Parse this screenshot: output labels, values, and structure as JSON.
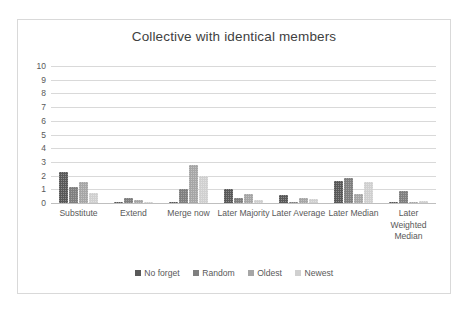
{
  "chart_data": {
    "type": "bar",
    "title": "Collective with identical members",
    "xlabel": "",
    "ylabel": "",
    "ylim": [
      0,
      10
    ],
    "yticks": [
      10,
      9,
      8,
      7,
      6,
      5,
      4,
      3,
      2,
      1,
      0
    ],
    "grid": true,
    "legend_position": "bottom",
    "categories": [
      "Substitute",
      "Extend",
      "Merge now",
      "Later Majority",
      "Later Average",
      "Later Median",
      "Later Weighted Median"
    ],
    "series": [
      {
        "name": "No forget",
        "color": "#595959",
        "values": [
          2.3,
          0.08,
          0.1,
          1.0,
          0.55,
          1.6,
          0.08
        ]
      },
      {
        "name": "Random",
        "color": "#7f7f7f",
        "values": [
          1.2,
          0.35,
          1.0,
          0.35,
          0.05,
          1.8,
          0.85
        ]
      },
      {
        "name": "Oldest",
        "color": "#a6a6a6",
        "values": [
          1.5,
          0.25,
          2.8,
          0.65,
          0.4,
          0.65,
          0.05
        ]
      },
      {
        "name": "Newest",
        "color": "#d0d0d0",
        "values": [
          0.75,
          0.03,
          2.0,
          0.22,
          0.28,
          1.5,
          0.15
        ]
      }
    ]
  },
  "colors": {
    "frame_border": "#d9d9d9",
    "gridline": "#d9d9d9",
    "text": "#595959",
    "title_text": "#3f3f3f",
    "background": "#ffffff"
  }
}
